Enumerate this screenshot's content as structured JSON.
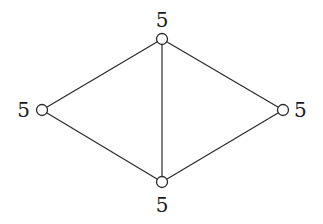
{
  "graph": {
    "nodes": [
      {
        "id": "top",
        "label": "5",
        "x": 162,
        "y": 39,
        "label_x": 162,
        "label_y": 27,
        "anchor": "middle"
      },
      {
        "id": "left",
        "label": "5",
        "x": 42,
        "y": 110,
        "label_x": 30,
        "label_y": 117,
        "anchor": "end"
      },
      {
        "id": "right",
        "label": "5",
        "x": 283,
        "y": 110,
        "label_x": 294,
        "label_y": 117,
        "anchor": "start"
      },
      {
        "id": "bottom",
        "label": "5",
        "x": 162,
        "y": 182,
        "label_x": 162,
        "label_y": 212,
        "anchor": "middle"
      }
    ],
    "edges": [
      {
        "from": "top",
        "to": "left"
      },
      {
        "from": "top",
        "to": "right"
      },
      {
        "from": "top",
        "to": "bottom"
      },
      {
        "from": "left",
        "to": "bottom"
      },
      {
        "from": "right",
        "to": "bottom"
      }
    ],
    "node_radius": 5.5
  }
}
